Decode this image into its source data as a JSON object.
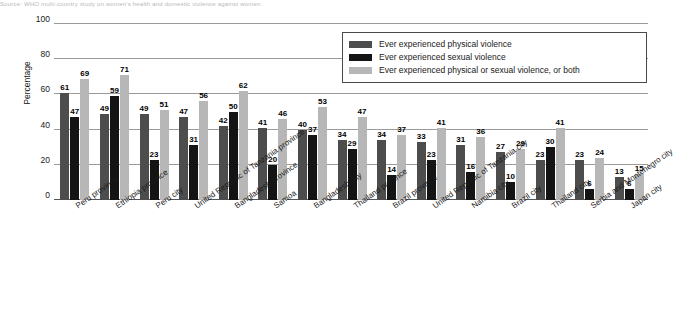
{
  "caption": {
    "text": "Source: WHO multi-country study on women's health and domestic violence against women."
  },
  "chart_data": {
    "type": "bar",
    "title": "",
    "subtitle": "",
    "xlabel": "",
    "ylabel": "Percentage",
    "ylim": [
      0,
      100
    ],
    "yticks": [
      0,
      20,
      40,
      60,
      80,
      100
    ],
    "grid": true,
    "legend_position": "top-right",
    "categories": [
      "Peru province",
      "Ethiopia province",
      "Peru city",
      "United Republic of Tanzania province",
      "Bangladesh province",
      "Samoa",
      "Bangladesh city",
      "Thailand province",
      "Brazil province",
      "United Republic of Tanzania city",
      "Namibia city",
      "Brazil city",
      "Thailand city",
      "Serbia and Montenegro city",
      "Japan city"
    ],
    "series": [
      {
        "name": "Ever experienced physical violence",
        "color": "#4d4d4d",
        "values": [
          61,
          49,
          49,
          47,
          42,
          41,
          40,
          34,
          34,
          33,
          31,
          27,
          23,
          23,
          13
        ]
      },
      {
        "name": "Ever experienced sexual violence",
        "color": "#141414",
        "values": [
          47,
          59,
          23,
          31,
          50,
          20,
          37,
          29,
          14,
          23,
          16,
          10,
          30,
          6,
          6
        ]
      },
      {
        "name": "Ever experienced physical or sexual violence, or both",
        "color": "#b7b7b7",
        "values": [
          69,
          71,
          51,
          56,
          62,
          46,
          53,
          47,
          37,
          41,
          36,
          29,
          41,
          24,
          15
        ]
      }
    ]
  }
}
